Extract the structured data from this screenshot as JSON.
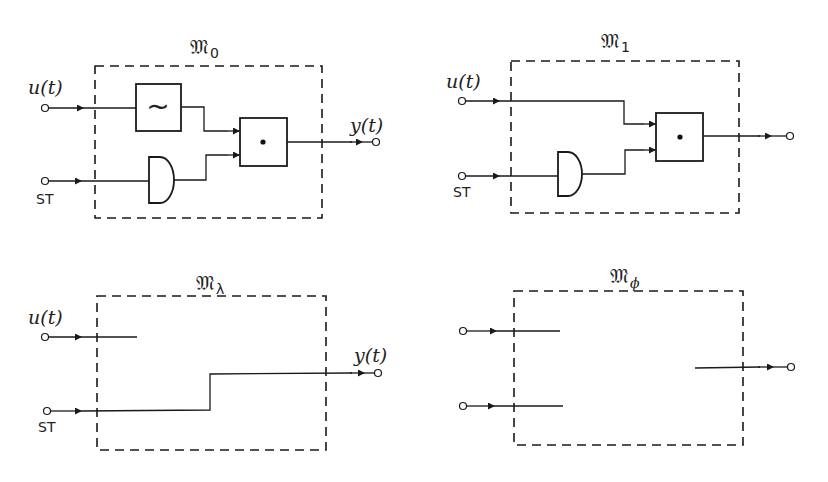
{
  "figure": {
    "panels": [
      {
        "id": "M0",
        "title": "𝔐",
        "subscript": "0",
        "inputs": [
          {
            "label": "u(t)"
          },
          {
            "label": "ST"
          }
        ],
        "output": {
          "label": "y(t)"
        },
        "blocks": [
          {
            "type": "filter",
            "symbol": "~"
          },
          {
            "type": "gate"
          },
          {
            "type": "multiplier",
            "symbol": "•"
          }
        ]
      },
      {
        "id": "M1",
        "title": "𝔐",
        "subscript": "1",
        "inputs": [
          {
            "label": "u(t)"
          },
          {
            "label": "ST"
          }
        ],
        "output": {
          "label": ""
        },
        "blocks": [
          {
            "type": "gate"
          },
          {
            "type": "multiplier",
            "symbol": "•"
          }
        ]
      },
      {
        "id": "Mlambda",
        "title": "𝔐",
        "subscript": "λ",
        "inputs": [
          {
            "label": "u(t)"
          },
          {
            "label": "ST"
          }
        ],
        "output": {
          "label": "y(t)"
        },
        "blocks": []
      },
      {
        "id": "Mphi",
        "title": "𝔐",
        "subscript": "ϕ",
        "inputs": [
          {
            "label": ""
          },
          {
            "label": ""
          }
        ],
        "output": {
          "label": ""
        },
        "blocks": []
      }
    ]
  },
  "labels": {
    "u": "u",
    "lp": "(",
    "t": "t",
    "rp": ")",
    "y": "y",
    "st": "ST",
    "tilde": "∼"
  }
}
